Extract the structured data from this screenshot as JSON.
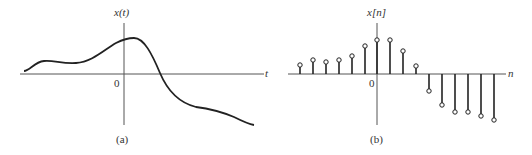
{
  "figure_a": {
    "y_label": "x(t)",
    "x_label": "t",
    "origin_label": "0",
    "caption": "(a)",
    "curve_path": "M24,71 C30,71 34,62 44,61 C54,60 62,64 76,63 C92,62 104,50 116,43 C122,40 128,38 134,38 C144,38 152,54 160,73 C168,92 180,103 196,107 C212,109 222,112 234,117 C242,121 248,124 254,125"
  },
  "figure_b": {
    "y_label": "x[n]",
    "x_label": "n",
    "origin_label": "0",
    "caption": "(b)",
    "axis_y": 74,
    "axis_x": 377,
    "stems": [
      {
        "x": 300,
        "h": 7
      },
      {
        "x": 313,
        "h": 12
      },
      {
        "x": 326,
        "h": 10
      },
      {
        "x": 339,
        "h": 12
      },
      {
        "x": 352,
        "h": 16
      },
      {
        "x": 365,
        "h": 26
      },
      {
        "x": 377,
        "h": 32
      },
      {
        "x": 390,
        "h": 32
      },
      {
        "x": 403,
        "h": 21
      },
      {
        "x": 416,
        "h": 6
      },
      {
        "x": 429,
        "h": -15
      },
      {
        "x": 442,
        "h": -29
      },
      {
        "x": 455,
        "h": -36
      },
      {
        "x": 468,
        "h": -36
      },
      {
        "x": 481,
        "h": -40
      },
      {
        "x": 494,
        "h": -44
      }
    ]
  }
}
